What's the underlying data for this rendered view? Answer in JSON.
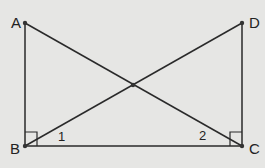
{
  "diagram": {
    "type": "geometry",
    "points": {
      "A": {
        "label": "A",
        "x": 25,
        "y": 23
      },
      "B": {
        "label": "B",
        "x": 25,
        "y": 146
      },
      "C": {
        "label": "C",
        "x": 242,
        "y": 146
      },
      "D": {
        "label": "D",
        "x": 242,
        "y": 23
      },
      "E": {
        "label": "",
        "x": 133,
        "y": 85
      }
    },
    "segments": [
      "AB",
      "BC",
      "CD",
      "AC",
      "BD"
    ],
    "right_angles": [
      "B",
      "C"
    ],
    "angle_labels": [
      {
        "label": "1",
        "at": "B",
        "between": "BC,BD"
      },
      {
        "label": "2",
        "at": "C",
        "between": "CB,CA"
      }
    ],
    "colors": {
      "line": "#2a2a2a",
      "background": "#e6e6e4"
    }
  }
}
